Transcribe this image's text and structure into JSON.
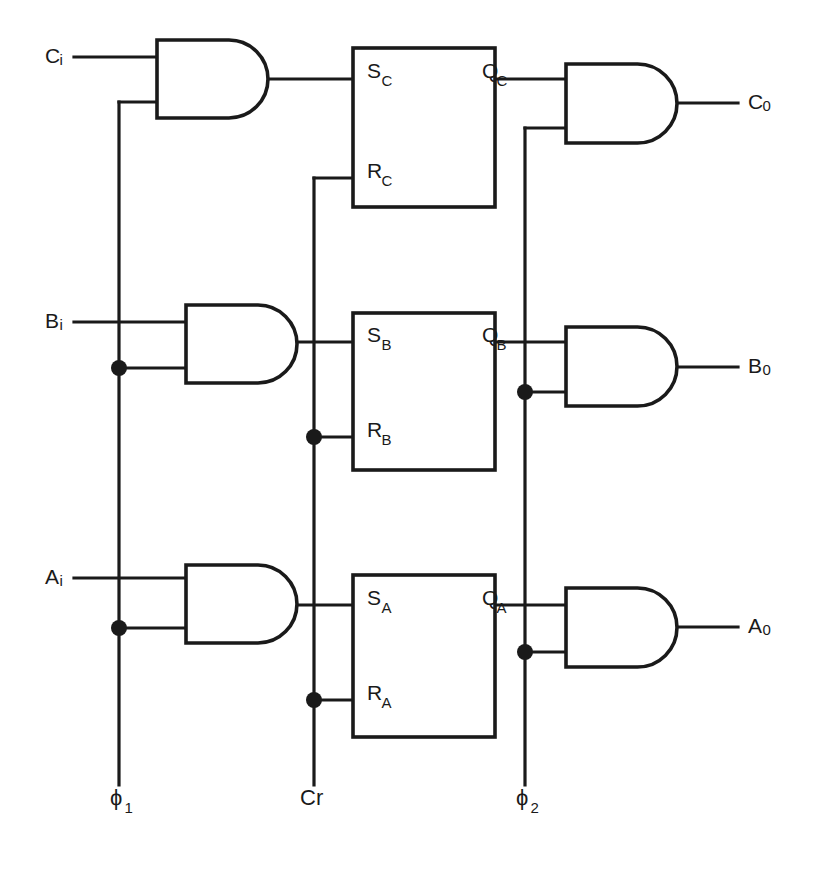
{
  "diagram": {
    "type": "logic-circuit-schematic",
    "canvas": {
      "width": 819,
      "height": 870
    },
    "colors": {
      "ink": "#1a1a1a",
      "background": "#ffffff"
    }
  },
  "inputs": [
    {
      "id": "ci",
      "label": "C",
      "sub": "i",
      "x": 45,
      "y": 57,
      "wire_y": 57,
      "wire_x1": 74,
      "wire_x2": 157
    },
    {
      "id": "bi",
      "label": "B",
      "sub": "i",
      "x": 45,
      "y": 322,
      "wire_y": 322,
      "wire_x1": 74,
      "wire_x2": 186
    },
    {
      "id": "ai",
      "label": "A",
      "sub": "i",
      "x": 45,
      "y": 578,
      "wire_y": 578,
      "wire_x1": 74,
      "wire_x2": 186
    }
  ],
  "outputs": [
    {
      "id": "co",
      "label": "C",
      "sub": "0",
      "x": 748,
      "y": 103,
      "wire_y": 103,
      "wire_x1": 677,
      "wire_x2": 738
    },
    {
      "id": "bo",
      "label": "B",
      "sub": "0",
      "x": 748,
      "y": 367,
      "wire_y": 367,
      "wire_x1": 677,
      "wire_x2": 738
    },
    {
      "id": "ao",
      "label": "A",
      "sub": "0",
      "x": 748,
      "y": 627,
      "wire_y": 627,
      "wire_x1": 677,
      "wire_x2": 738
    }
  ],
  "clock_lines": [
    {
      "id": "phi1",
      "label": "ϕ",
      "sub": "1",
      "x": 119,
      "label_x": 110,
      "label_y": 805,
      "top_y": 102,
      "bottom_y": 785
    },
    {
      "id": "cr",
      "label": "Cr",
      "sub": "",
      "x": 314,
      "label_x": 300,
      "label_y": 805,
      "top_y": 178,
      "bottom_y": 785
    },
    {
      "id": "phi2",
      "label": "ϕ",
      "sub": "2",
      "x": 525,
      "label_x": 516,
      "label_y": 805,
      "top_y": 128,
      "bottom_y": 785
    }
  ],
  "input_gates": [
    {
      "id": "and-c-in",
      "name": "and-gate-c-input",
      "x": 157,
      "y": 40,
      "w": 111,
      "h": 78,
      "in_top_y": 57,
      "in_bot_y": 102,
      "out_y": 79,
      "out_x2": 353
    },
    {
      "id": "and-b-in",
      "name": "and-gate-b-input",
      "x": 186,
      "y": 305,
      "w": 111,
      "h": 78,
      "in_top_y": 322,
      "in_bot_y": 368,
      "out_y": 342,
      "out_x2": 353
    },
    {
      "id": "and-a-in",
      "name": "and-gate-a-input",
      "x": 186,
      "y": 565,
      "w": 111,
      "h": 78,
      "in_top_y": 578,
      "in_bot_y": 628,
      "out_y": 605,
      "out_x2": 353
    }
  ],
  "output_gates": [
    {
      "id": "and-c-out",
      "name": "and-gate-c-output",
      "x": 566,
      "y": 64,
      "w": 111,
      "h": 79,
      "in_top_y": 79,
      "in_bot_y": 128,
      "out_y": 103,
      "in_top_x1": 495
    },
    {
      "id": "and-b-out",
      "name": "and-gate-b-output",
      "x": 566,
      "y": 327,
      "w": 111,
      "h": 79,
      "in_top_y": 342,
      "in_bot_y": 392,
      "out_y": 367,
      "in_top_x1": 495
    },
    {
      "id": "and-a-out",
      "name": "and-gate-a-output",
      "x": 566,
      "y": 588,
      "w": 111,
      "h": 79,
      "in_top_y": 605,
      "in_bot_y": 652,
      "out_y": 627,
      "in_top_x1": 495
    }
  ],
  "flipflops": [
    {
      "id": "ff-c",
      "name": "flipflop-c",
      "x": 353,
      "y": 48,
      "w": 142,
      "h": 159,
      "pins": [
        {
          "id": "sc",
          "label": "S",
          "sub": "C",
          "side": "left",
          "x": 367,
          "y": 78,
          "wire_x1": 314,
          "wire_y": 78
        },
        {
          "id": "rc",
          "label": "R",
          "sub": "C",
          "side": "left",
          "x": 367,
          "y": 178,
          "wire_x1": 314,
          "wire_y": 178
        },
        {
          "id": "qc",
          "label": "Q",
          "sub": "C",
          "side": "right",
          "x": 482,
          "y": 78,
          "wire_x2": 566,
          "wire_y": 79
        }
      ]
    },
    {
      "id": "ff-b",
      "name": "flipflop-b",
      "x": 353,
      "y": 313,
      "w": 142,
      "h": 157,
      "pins": [
        {
          "id": "sb",
          "label": "S",
          "sub": "B",
          "side": "left",
          "x": 367,
          "y": 342,
          "wire_x1": 297,
          "wire_y": 342
        },
        {
          "id": "rb",
          "label": "R",
          "sub": "B",
          "side": "left",
          "x": 367,
          "y": 437,
          "wire_x1": 314,
          "wire_y": 437
        },
        {
          "id": "qb",
          "label": "Q",
          "sub": "B",
          "side": "right",
          "x": 482,
          "y": 342,
          "wire_x2": 566,
          "wire_y": 342
        }
      ]
    },
    {
      "id": "ff-a",
      "name": "flipflop-a",
      "x": 353,
      "y": 575,
      "w": 142,
      "h": 162,
      "pins": [
        {
          "id": "sa",
          "label": "S",
          "sub": "A",
          "side": "left",
          "x": 367,
          "y": 605,
          "wire_x1": 297,
          "wire_y": 605
        },
        {
          "id": "ra",
          "label": "R",
          "sub": "A",
          "side": "left",
          "x": 367,
          "y": 700,
          "wire_x1": 314,
          "wire_y": 700
        },
        {
          "id": "qa",
          "label": "Q",
          "sub": "A",
          "side": "right",
          "x": 482,
          "y": 605,
          "wire_x2": 566,
          "wire_y": 605
        }
      ]
    }
  ],
  "junction_dots": [
    {
      "id": "dot-phi1-b",
      "x": 119,
      "y": 368,
      "r": 8
    },
    {
      "id": "dot-phi1-a",
      "x": 119,
      "y": 628,
      "r": 8
    },
    {
      "id": "dot-cr-rb",
      "x": 314,
      "y": 437,
      "r": 8
    },
    {
      "id": "dot-cr-ra",
      "x": 314,
      "y": 700,
      "r": 8
    },
    {
      "id": "dot-phi2-b",
      "x": 525,
      "y": 392,
      "r": 8
    },
    {
      "id": "dot-phi2-a",
      "x": 525,
      "y": 652,
      "r": 8
    }
  ],
  "connector_wires": [
    {
      "id": "w-phi1-to-cgate",
      "d": "M 119 102 L 157 102"
    },
    {
      "id": "w-phi1-to-bgate",
      "d": "M 119 368 L 186 368"
    },
    {
      "id": "w-phi1-to-agate",
      "d": "M 119 628 L 186 628"
    },
    {
      "id": "w-cr-to-rc",
      "d": "M 314 178 L 353 178"
    },
    {
      "id": "w-cr-to-rb",
      "d": "M 314 437 L 353 437"
    },
    {
      "id": "w-cr-to-ra",
      "d": "M 314 700 L 353 700"
    },
    {
      "id": "w-phi2-to-cgate",
      "d": "M 525 128 L 566 128"
    },
    {
      "id": "w-phi2-to-bgate",
      "d": "M 525 392 L 566 392"
    },
    {
      "id": "w-phi2-to-agate",
      "d": "M 525 652 L 566 652"
    },
    {
      "id": "w-qc-to-cgate",
      "d": "M 495 79 L 566 79"
    },
    {
      "id": "w-qb-to-bgate",
      "d": "M 495 342 L 566 342"
    },
    {
      "id": "w-qa-to-agate",
      "d": "M 495 605 L 566 605"
    }
  ]
}
